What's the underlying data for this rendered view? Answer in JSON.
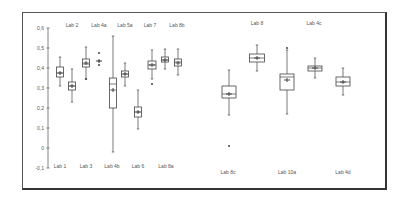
{
  "chart_data": {
    "type": "boxplot",
    "title": "",
    "xlabel": "",
    "ylabel": "",
    "ylim": [
      -0.1,
      0.6
    ],
    "yticks": [
      "0,6",
      "0,5",
      "0,4",
      "0,3",
      "0,2",
      "0,1",
      "0",
      "-0,1"
    ],
    "ytick_values": [
      0.6,
      0.5,
      0.4,
      0.3,
      0.2,
      0.1,
      0,
      -0.1
    ],
    "grid": false,
    "legend": null,
    "series": [
      {
        "name": "Lab 1",
        "label_pos": "bottom",
        "whisker_low": 0.31,
        "q1": 0.355,
        "median": 0.375,
        "mean": 0.375,
        "q3": 0.405,
        "whisker_high": 0.455,
        "outliers": []
      },
      {
        "name": "Lab 3",
        "label_pos": "bottom",
        "whisker_low": 0.23,
        "q1": 0.29,
        "median": 0.31,
        "mean": 0.31,
        "q3": 0.33,
        "whisker_high": 0.395,
        "outliers": []
      },
      {
        "name": "Lab 2",
        "label_pos": "top",
        "whisker_low": 0.345,
        "q1": 0.405,
        "median": 0.42,
        "mean": 0.425,
        "q3": 0.445,
        "whisker_high": 0.505,
        "outliers": [
          0.345
        ]
      },
      {
        "name": "Lab 4a",
        "label_pos": "top",
        "whisker_low": 0.435,
        "q1": 0.435,
        "median": 0.435,
        "mean": 0.435,
        "q3": 0.435,
        "whisker_high": 0.435,
        "outliers": [
          0.475,
          0.415
        ]
      },
      {
        "name": "Lab 4b",
        "label_pos": "bottom",
        "whisker_low": -0.02,
        "q1": 0.2,
        "median": 0.32,
        "mean": 0.29,
        "q3": 0.35,
        "whisker_high": 0.56,
        "outliers": []
      },
      {
        "name": "Lab 5a",
        "label_pos": "top",
        "whisker_low": 0.31,
        "q1": 0.355,
        "median": 0.37,
        "mean": 0.37,
        "q3": 0.385,
        "whisker_high": 0.425,
        "outliers": []
      },
      {
        "name": "Lab 6",
        "label_pos": "bottom",
        "whisker_low": 0.095,
        "q1": 0.155,
        "median": 0.18,
        "mean": 0.18,
        "q3": 0.205,
        "whisker_high": 0.29,
        "outliers": []
      },
      {
        "name": "Lab 7",
        "label_pos": "top",
        "whisker_low": 0.345,
        "q1": 0.395,
        "median": 0.415,
        "mean": 0.415,
        "q3": 0.435,
        "whisker_high": 0.49,
        "outliers": [
          0.32
        ]
      },
      {
        "name": "Lab 8a",
        "label_pos": "bottom",
        "whisker_low": 0.395,
        "q1": 0.43,
        "median": 0.44,
        "mean": 0.44,
        "q3": 0.455,
        "whisker_high": 0.495,
        "outliers": []
      },
      {
        "name": "Lab 8b",
        "label_pos": "top",
        "whisker_low": 0.365,
        "q1": 0.41,
        "median": 0.43,
        "mean": 0.425,
        "q3": 0.445,
        "whisker_high": 0.495,
        "outliers": []
      },
      {
        "name": "Lab 8c",
        "label_pos": "bottom",
        "whisker_low": 0.165,
        "q1": 0.25,
        "median": 0.27,
        "mean": 0.27,
        "q3": 0.31,
        "whisker_high": 0.39,
        "outliers": [
          0.01
        ]
      },
      {
        "name": "Lab 8",
        "label_pos": "top",
        "whisker_low": 0.385,
        "q1": 0.43,
        "median": 0.45,
        "mean": 0.45,
        "q3": 0.47,
        "whisker_high": 0.515,
        "outliers": []
      },
      {
        "name": "Lab 10a",
        "label_pos": "bottom",
        "whisker_low": 0.17,
        "q1": 0.29,
        "median": 0.355,
        "mean": 0.34,
        "q3": 0.37,
        "whisker_high": 0.49,
        "outliers": [
          0.5
        ]
      },
      {
        "name": "Lab 4c",
        "label_pos": "top",
        "whisker_low": 0.35,
        "q1": 0.385,
        "median": 0.4,
        "mean": 0.4,
        "q3": 0.41,
        "whisker_high": 0.45,
        "outliers": []
      },
      {
        "name": "Lab 4d",
        "label_pos": "bottom",
        "whisker_low": 0.265,
        "q1": 0.31,
        "median": 0.33,
        "mean": 0.33,
        "q3": 0.355,
        "whisker_high": 0.4,
        "outliers": []
      }
    ]
  },
  "layout": {
    "x_centers": [
      60,
      72,
      86,
      99,
      113,
      125,
      138,
      152,
      165,
      178,
      229,
      257,
      287,
      315,
      343
    ],
    "box_widths": [
      7,
      7,
      7,
      0,
      7,
      7,
      7,
      8,
      7,
      7,
      14,
      15,
      14,
      14,
      14
    ],
    "label_x": [
      60,
      86,
      72,
      99,
      112,
      125,
      138,
      150,
      166,
      177,
      228,
      257,
      287,
      314,
      343
    ],
    "label_y_top": [
      27,
      27,
      27,
      27,
      27,
      27,
      27,
      27,
      27,
      27,
      27,
      25,
      27,
      25,
      27
    ],
    "label_y_bottom": 168,
    "label_y_bottom_right": 174
  }
}
